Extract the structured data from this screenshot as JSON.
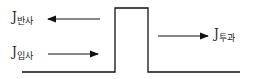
{
  "diagram": {
    "type": "potential-barrier-flux",
    "labels": {
      "reflected": {
        "main": "J",
        "sub": "반사"
      },
      "incident": {
        "main": "J",
        "sub": "입사"
      },
      "transmitted": {
        "main": "J",
        "sub": "투과"
      }
    },
    "colors": {
      "line": "#111111",
      "background": "#ffffff"
    }
  }
}
